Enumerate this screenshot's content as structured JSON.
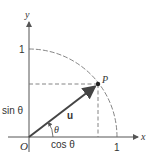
{
  "diagram": {
    "type": "unit-circle-vector",
    "colors": {
      "axis": "#555555",
      "arc": "#666666",
      "vector": "#444444",
      "dashed": "#777777",
      "text": "#333333"
    },
    "axes": {
      "x_label": "x",
      "y_label": "y"
    },
    "ticks": {
      "x_one": "1",
      "y_one": "1"
    },
    "origin_label": "O",
    "point_label": "P",
    "vector_label": "u",
    "angle_label": "θ",
    "projections": {
      "horizontal": "cos θ",
      "vertical": "sin θ"
    },
    "angle_degrees": 37
  }
}
